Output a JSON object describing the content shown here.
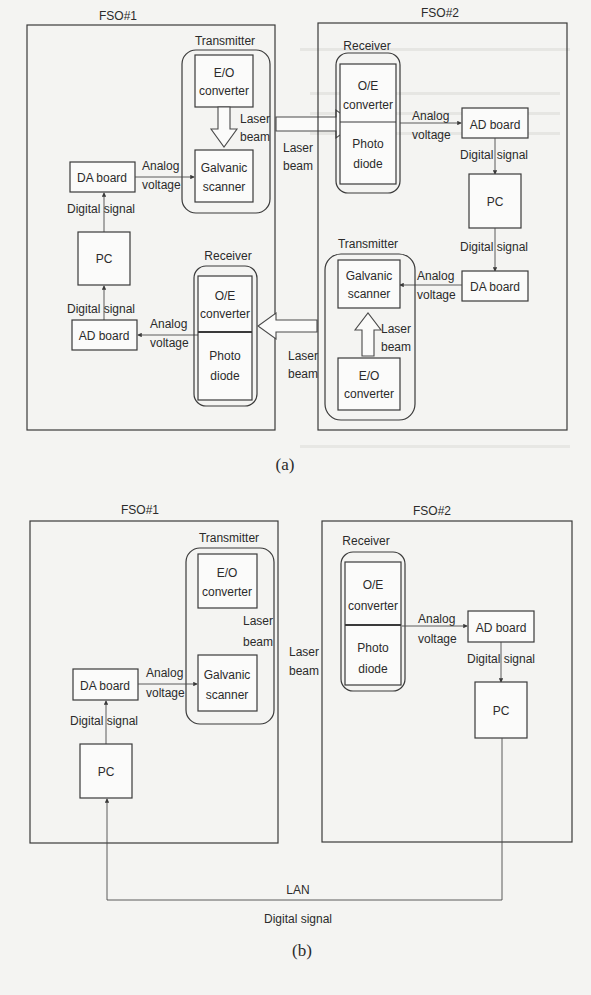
{
  "figure_a": {
    "caption": "(a)",
    "fso1": {
      "title": "FSO#1",
      "transmitter": {
        "label": "Transmitter",
        "eo": [
          "E/O",
          "converter"
        ],
        "laser": [
          "Laser",
          "beam"
        ],
        "galvanic": [
          "Galvanic",
          "scanner"
        ]
      },
      "receiver": {
        "label": "Receiver",
        "oe": [
          "O/E",
          "converter"
        ],
        "photo": [
          "Photo",
          "diode"
        ]
      },
      "da_board": "DA board",
      "ad_board": "AD board",
      "pc": "PC",
      "digital_signal_1": "Digital signal",
      "digital_signal_2": "Digital signal",
      "analog_1": [
        "Analog",
        "voltage"
      ],
      "analog_2": [
        "Analog",
        "voltage"
      ]
    },
    "link_top": [
      "Laser",
      "beam"
    ],
    "link_bottom": [
      "Laser",
      "beam"
    ],
    "fso2": {
      "title": "FSO#2",
      "receiver": {
        "label": "Receiver",
        "oe": [
          "O/E",
          "converter"
        ],
        "photo": [
          "Photo",
          "diode"
        ]
      },
      "transmitter": {
        "label": "Transmitter",
        "galvanic": [
          "Galvanic",
          "scanner"
        ],
        "laser": [
          "Laser",
          "beam"
        ],
        "eo": [
          "E/O",
          "converter"
        ]
      },
      "ad_board": "AD board",
      "da_board": "DA board",
      "pc": "PC",
      "digital_signal_1": "Digital signal",
      "digital_signal_2": "Digital signal",
      "analog_1": [
        "Analog",
        "voltage"
      ],
      "analog_2": [
        "Analog",
        "voltage"
      ]
    }
  },
  "figure_b": {
    "caption": "(b)",
    "fso1": {
      "title": "FSO#1",
      "transmitter": {
        "label": "Transmitter",
        "eo": [
          "E/O",
          "converter"
        ],
        "laser": [
          "Laser",
          "beam"
        ],
        "galvanic": [
          "Galvanic",
          "scanner"
        ]
      },
      "da_board": "DA board",
      "pc": "PC",
      "digital_signal": "Digital signal",
      "analog": [
        "Analog",
        "voltage"
      ]
    },
    "link": [
      "Laser",
      "beam"
    ],
    "fso2": {
      "title": "FSO#2",
      "receiver": {
        "label": "Receiver",
        "oe": [
          "O/E",
          "converter"
        ],
        "photo": [
          "Photo",
          "diode"
        ]
      },
      "ad_board": "AD board",
      "pc": "PC",
      "digital_signal": "Digital signal",
      "analog": [
        "Analog",
        "voltage"
      ]
    },
    "lan_label": "LAN",
    "lan_signal": "Digital signal"
  }
}
